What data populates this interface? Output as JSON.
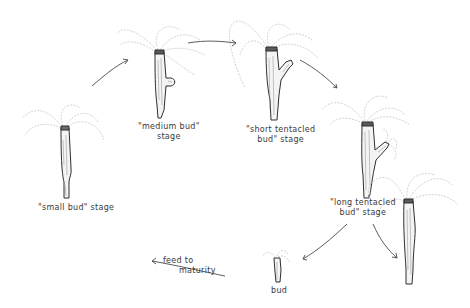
{
  "diagram": {
    "colors": {
      "ink": "#2f2f2f",
      "tentacle": "#c8c8c8",
      "background": "#ffffff"
    },
    "stages": [
      {
        "id": "small-bud",
        "label": "\"small bud\" stage"
      },
      {
        "id": "medium-bud",
        "label_line1": "\"medium  bud\"",
        "label_line2": "stage"
      },
      {
        "id": "short-tentacled-bud",
        "label_line1": "\"short tentacled",
        "label_line2": "bud\" stage"
      },
      {
        "id": "long-tentacled-bud",
        "label_line1": "\"long tentacled",
        "label_line2": "bud\" stage"
      },
      {
        "id": "bud",
        "label": "bud"
      }
    ],
    "arrows": [
      {
        "from": "small-bud",
        "to": "medium-bud"
      },
      {
        "from": "medium-bud",
        "to": "short-tentacled-bud"
      },
      {
        "from": "short-tentacled-bud",
        "to": "long-tentacled-bud"
      },
      {
        "from": "long-tentacled-bud",
        "to": "bud"
      },
      {
        "from": "long-tentacled-bud",
        "to": "parent-hydra"
      },
      {
        "from": "bud",
        "to": "maturity",
        "label_line1": "feed to",
        "label_line2": "maturity"
      }
    ]
  }
}
